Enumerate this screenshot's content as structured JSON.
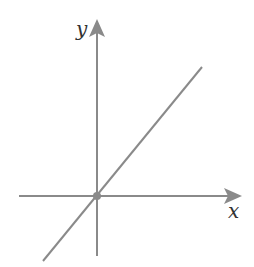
{
  "diagram": {
    "type": "coordinate-plane-line",
    "x_axis_label": "x",
    "y_axis_label": "y",
    "line": "straight line through origin with positive slope",
    "origin_marker": "dot",
    "colors": {
      "axis": "#8a8a8a",
      "line": "#8a8a8a",
      "label": "#333333",
      "background": "#ffffff"
    }
  }
}
